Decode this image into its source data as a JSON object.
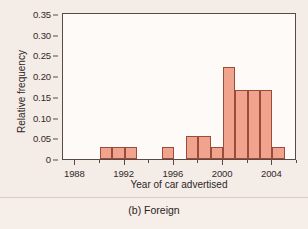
{
  "caption": "(b) Foreign",
  "colors": {
    "background": "#f4ece7",
    "plot_background": "#fdfaf8",
    "bar_fill": "#f0a48e",
    "bar_edge": "#9c4a3a",
    "axis": "#5a4a46",
    "text": "#2e2526"
  },
  "chart_data": {
    "type": "bar",
    "title": "",
    "subtitle": "",
    "xlabel": "Year of car advertised",
    "ylabel": "Relative frequency",
    "xlim": [
      1987,
      2006
    ],
    "ylim": [
      0,
      0.355
    ],
    "grid": false,
    "legend": null,
    "bin_width": 1,
    "x_ticks": [
      {
        "value": 1988,
        "label": "1988",
        "major": true
      },
      {
        "value": 1990,
        "label": "",
        "major": false
      },
      {
        "value": 1992,
        "label": "1992",
        "major": true
      },
      {
        "value": 1994,
        "label": "",
        "major": false
      },
      {
        "value": 1996,
        "label": "1996",
        "major": true
      },
      {
        "value": 1998,
        "label": "",
        "major": false
      },
      {
        "value": 2000,
        "label": "2000",
        "major": true
      },
      {
        "value": 2002,
        "label": "",
        "major": false
      },
      {
        "value": 2004,
        "label": "2004",
        "major": true
      },
      {
        "value": 2006,
        "label": "",
        "major": false
      }
    ],
    "y_ticks": [
      {
        "value": 0,
        "label": "0"
      },
      {
        "value": 0.05,
        "label": "0.05"
      },
      {
        "value": 0.1,
        "label": "0.10"
      },
      {
        "value": 0.15,
        "label": "0.15"
      },
      {
        "value": 0.2,
        "label": "0.20"
      },
      {
        "value": 0.25,
        "label": "0.25"
      },
      {
        "value": 0.3,
        "label": "0.30"
      },
      {
        "value": 0.35,
        "label": "0.35"
      }
    ],
    "categories": [
      1990,
      1991,
      1992,
      1995,
      1997,
      1998,
      1999,
      2000,
      2001,
      2002,
      2003,
      2004
    ],
    "values": [
      0.028,
      0.028,
      0.028,
      0.028,
      0.055,
      0.055,
      0.028,
      0.223,
      0.166,
      0.166,
      0.166,
      0.028
    ],
    "bars": [
      {
        "x_start": 1990,
        "x_end": 1991,
        "value": 0.028
      },
      {
        "x_start": 1991,
        "x_end": 1992,
        "value": 0.028
      },
      {
        "x_start": 1992,
        "x_end": 1993,
        "value": 0.028
      },
      {
        "x_start": 1995,
        "x_end": 1996,
        "value": 0.028
      },
      {
        "x_start": 1997,
        "x_end": 1998,
        "value": 0.055
      },
      {
        "x_start": 1998,
        "x_end": 1999,
        "value": 0.055
      },
      {
        "x_start": 1999,
        "x_end": 2000,
        "value": 0.028
      },
      {
        "x_start": 2000,
        "x_end": 2001,
        "value": 0.223
      },
      {
        "x_start": 2001,
        "x_end": 2002,
        "value": 0.166
      },
      {
        "x_start": 2002,
        "x_end": 2003,
        "value": 0.166
      },
      {
        "x_start": 2003,
        "x_end": 2004,
        "value": 0.166
      },
      {
        "x_start": 2004,
        "x_end": 2005,
        "value": 0.028
      }
    ]
  }
}
